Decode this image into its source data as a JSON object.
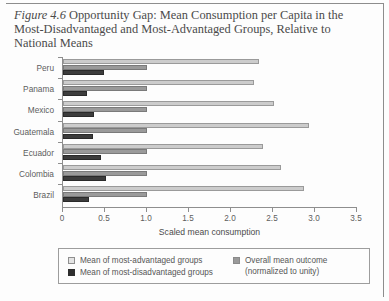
{
  "figure": {
    "number_label": "Figure 4.6",
    "caption_rest": " Opportunity Gap: Mean Consumption per Capita in the Most-Disadvantaged and Most-Advantaged Groups, Relative to National Means"
  },
  "legend": {
    "items": [
      {
        "swatch": "light-gray-swatch",
        "label": "Mean of most-advantaged groups",
        "color": "#e4e4e4"
      },
      {
        "swatch": "dark-swatch",
        "label": "Mean of most-disadvantaged groups",
        "color": "#2e2e2e"
      },
      {
        "swatch": "medium-gray-swatch",
        "label_line1": "Overall mean outcome",
        "label_line2": "(normalized to unity)",
        "color": "#9a9a9a"
      }
    ]
  },
  "chart_data": {
    "type": "bar",
    "orientation": "horizontal",
    "title": "Opportunity Gap: Mean Consumption per Capita in the Most-Disadvantaged and Most-Advantaged Groups, Relative to National Means",
    "xlabel": "Scaled mean consumption",
    "ylabel": "",
    "xlim": [
      0,
      3.5
    ],
    "xticks": [
      0,
      0.5,
      1.0,
      1.5,
      2.0,
      2.5,
      3.0,
      3.5
    ],
    "xtick_labels": [
      "0",
      "0.5",
      "1.0",
      "1.5",
      "2.0",
      "2.5",
      "3.0",
      "3.5"
    ],
    "grid": false,
    "legend_position": "bottom",
    "categories": [
      "Peru",
      "Panama",
      "Mexico",
      "Guatemala",
      "Ecuador",
      "Colombia",
      "Brazil"
    ],
    "series": [
      {
        "name": "Mean of most-advantaged groups",
        "color": "#cccccc",
        "values": [
          2.33,
          2.27,
          2.51,
          2.93,
          2.38,
          2.59,
          2.87
        ]
      },
      {
        "name": "Overall mean outcome (normalized to unity)",
        "color": "#9a9a9a",
        "values": [
          1.0,
          1.0,
          1.0,
          1.0,
          1.0,
          1.0,
          1.0
        ]
      },
      {
        "name": "Mean of most-disadvantaged groups",
        "color": "#3c3c3c",
        "values": [
          0.49,
          0.29,
          0.37,
          0.36,
          0.45,
          0.51,
          0.31
        ]
      }
    ]
  }
}
